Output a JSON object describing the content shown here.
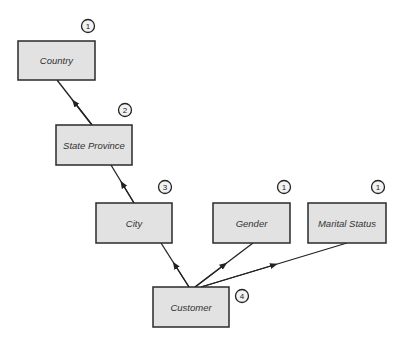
{
  "diagram": {
    "title": "",
    "nodes": [
      {
        "id": "country",
        "label": "Country",
        "badge": "1",
        "x": 18,
        "y": 41,
        "w": 77,
        "h": 39,
        "bx": 88,
        "by": 26
      },
      {
        "id": "state_province",
        "label": "State Province",
        "badge": "2",
        "x": 56,
        "y": 125,
        "w": 76,
        "h": 40,
        "bx": 125,
        "by": 110
      },
      {
        "id": "city",
        "label": "City",
        "badge": "3",
        "x": 96,
        "y": 203,
        "w": 76,
        "h": 40,
        "bx": 165,
        "by": 187
      },
      {
        "id": "gender",
        "label": "Gender",
        "badge": "1",
        "x": 213,
        "y": 203,
        "w": 77,
        "h": 40,
        "bx": 284,
        "by": 187
      },
      {
        "id": "marital_status",
        "label": "Marital Status",
        "badge": "1",
        "x": 308,
        "y": 203,
        "w": 78,
        "h": 40,
        "bx": 378,
        "by": 187
      },
      {
        "id": "customer",
        "label": "Customer",
        "badge": "4",
        "x": 153,
        "y": 287,
        "w": 76,
        "h": 40,
        "bx": 242,
        "by": 296
      }
    ],
    "edges": [
      {
        "from": "state_province",
        "to": "country",
        "x1": 92,
        "y1": 125,
        "x2": 57,
        "y2": 80
      },
      {
        "from": "city",
        "to": "state_province",
        "x1": 134,
        "y1": 203,
        "x2": 111,
        "y2": 165
      },
      {
        "from": "customer",
        "to": "city",
        "x1": 189,
        "y1": 287,
        "x2": 161,
        "y2": 243
      },
      {
        "from": "customer",
        "to": "gender",
        "x1": 195,
        "y1": 287,
        "x2": 253,
        "y2": 243
      },
      {
        "from": "customer",
        "to": "marital_status",
        "x1": 201,
        "y1": 287,
        "x2": 347,
        "y2": 243
      }
    ]
  }
}
